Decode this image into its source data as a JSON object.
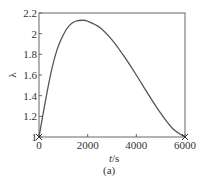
{
  "chart_data": {
    "type": "line",
    "title": "",
    "subcaption": "(a)",
    "xlabel": "t/s",
    "xlabel_var": "t",
    "xlabel_unit": "/s",
    "ylabel": "λ",
    "xlim": [
      0,
      6000
    ],
    "ylim": [
      1,
      2.2
    ],
    "xticks": [
      0,
      2000,
      4000,
      6000
    ],
    "xtick_labels": [
      "0",
      "2000",
      "4000",
      "6000"
    ],
    "yticks": [
      1,
      1.2,
      1.4,
      1.6,
      1.8,
      2,
      2.2
    ],
    "ytick_labels": [
      "1",
      "1.2",
      "1.4",
      "1.6",
      "1.8",
      "2",
      "2.2"
    ],
    "grid": false,
    "legend": null,
    "line_color": "#555555",
    "series": [
      {
        "name": "curve",
        "x": [
          0,
          250,
          500,
          750,
          1000,
          1250,
          1500,
          1800,
          2000,
          2500,
          3000,
          3500,
          4000,
          4500,
          5000,
          5500,
          6000
        ],
        "y": [
          1.0,
          1.33,
          1.63,
          1.85,
          1.99,
          2.08,
          2.12,
          2.13,
          2.12,
          2.06,
          1.94,
          1.78,
          1.6,
          1.41,
          1.23,
          1.08,
          1.0
        ]
      }
    ],
    "markers": [
      {
        "x": 0,
        "y": 1,
        "symbol": "x"
      },
      {
        "x": 6000,
        "y": 1,
        "symbol": "x"
      }
    ]
  }
}
